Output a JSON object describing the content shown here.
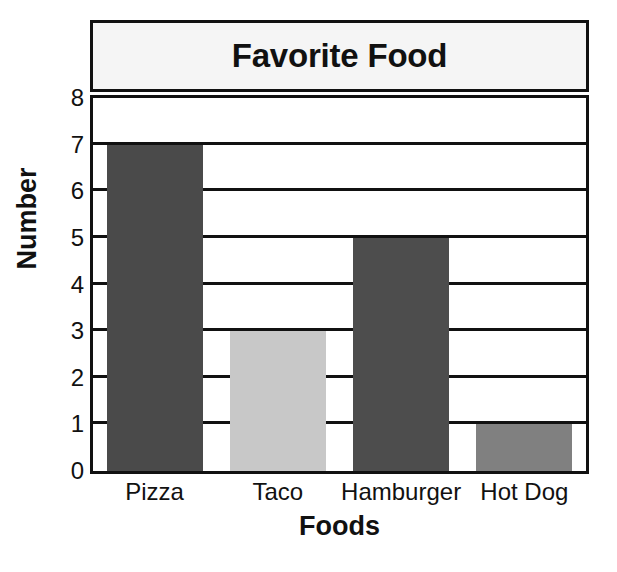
{
  "chart_data": {
    "type": "bar",
    "title": "Favorite Food",
    "xlabel": "Foods",
    "ylabel": "Number",
    "categories": [
      "Pizza",
      "Taco",
      "Hamburger",
      "Hot Dog"
    ],
    "values": [
      7,
      3,
      5,
      1
    ],
    "bar_colors": [
      "#4a4a4a",
      "#c8c8c8",
      "#4d4d4d",
      "#808080"
    ],
    "ylim": [
      0,
      8
    ],
    "ytick_labels": [
      "0",
      "1",
      "2",
      "3",
      "4",
      "5",
      "6",
      "7",
      "8"
    ],
    "ytick_values": [
      0,
      1,
      2,
      3,
      4,
      5,
      6,
      7,
      8
    ],
    "grid": true,
    "grid_orientation": "horizontal",
    "legend": null,
    "legend_position": "none",
    "annotations": [],
    "series": [
      {
        "name": "Number",
        "values": [
          7,
          3,
          5,
          1
        ]
      }
    ]
  },
  "style": {
    "title_box_fill": "#f5f5f5",
    "frame_color": "#111111",
    "plot_background": "#ffffff",
    "text_color": "#111111"
  }
}
